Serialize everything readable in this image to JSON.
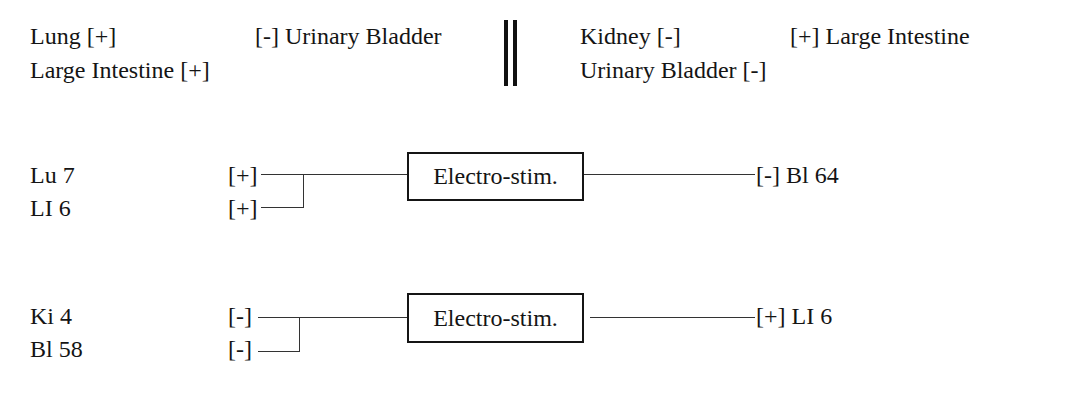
{
  "header": {
    "left": {
      "row1_left": "Lung [+]",
      "row1_right": "[-] Urinary Bladder",
      "row2_left": "Large Intestine [+]"
    },
    "right": {
      "row1_left": "Kidney [-]",
      "row1_right": "[+] Large Intestine",
      "row2_left": "Urinary Bladder [-]"
    }
  },
  "circuits": [
    {
      "inputs": [
        {
          "point": "Lu 7",
          "polarity": "[+]"
        },
        {
          "point": "LI 6",
          "polarity": "[+]"
        }
      ],
      "device": "Electro-stim.",
      "output": "[-] Bl 64"
    },
    {
      "inputs": [
        {
          "point": "Ki 4",
          "polarity": "[-]"
        },
        {
          "point": "Bl 58",
          "polarity": "[-]"
        }
      ],
      "device": "Electro-stim.",
      "output": "[+] LI 6"
    }
  ]
}
